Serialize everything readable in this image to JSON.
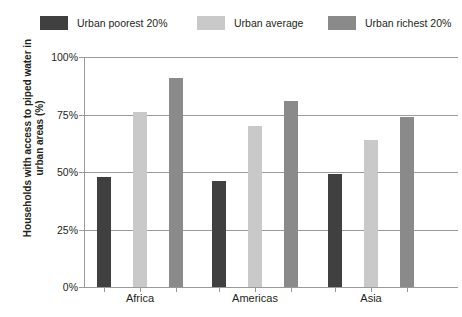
{
  "chart_data": {
    "type": "bar",
    "title": "",
    "subtitle": "",
    "xlabel": "",
    "ylabel": "Households with access to piped water in urban areas (%)",
    "categories": [
      "Africa",
      "Americas",
      "Asia"
    ],
    "series": [
      {
        "name": "Urban poorest 20%",
        "color": "#404040",
        "values": [
          48,
          46,
          49
        ]
      },
      {
        "name": "Urban average",
        "color": "#c9c9c9",
        "values": [
          76,
          70,
          64
        ]
      },
      {
        "name": "Urban richest 20%",
        "color": "#8a8a8a",
        "values": [
          91,
          81,
          74
        ]
      }
    ],
    "ylim": [
      0,
      100
    ],
    "yticks": [
      0,
      25,
      50,
      75,
      100
    ],
    "ytick_labels": [
      "0%",
      "25%",
      "50%",
      "75%",
      "100%"
    ],
    "grid": "horizontal",
    "legend_position": "top"
  },
  "legend": {
    "items": [
      {
        "label": "Urban poorest 20%"
      },
      {
        "label": "Urban average"
      },
      {
        "label": "Urban richest 20%"
      }
    ]
  },
  "axis": {
    "y_title": "Households with access to piped water in urban areas (%)",
    "y_title_line1": "Households with access to piped water in",
    "y_title_line2": "urban areas (%)"
  }
}
